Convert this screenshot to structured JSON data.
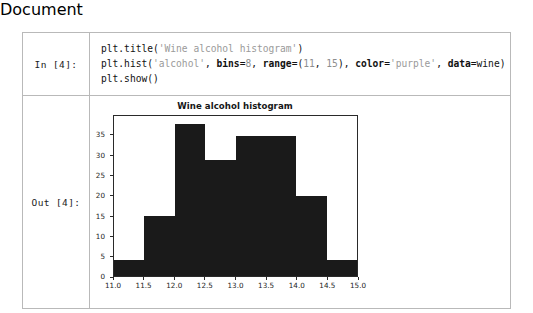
{
  "notebook": {
    "input": {
      "prompt": "In [4]:",
      "lines": [
        [
          {
            "t": "plt.title(",
            "c": "plain"
          },
          {
            "t": "'Wine alcohol histogram'",
            "c": "str"
          },
          {
            "t": ")",
            "c": "plain"
          }
        ],
        [
          {
            "t": "plt.hist(",
            "c": "plain"
          },
          {
            "t": "'alcohol'",
            "c": "str"
          },
          {
            "t": ", ",
            "c": "plain"
          },
          {
            "t": "bins",
            "c": "kw"
          },
          {
            "t": "=",
            "c": "plain"
          },
          {
            "t": "8",
            "c": "num"
          },
          {
            "t": ", ",
            "c": "plain"
          },
          {
            "t": "range",
            "c": "kw"
          },
          {
            "t": "=(",
            "c": "plain"
          },
          {
            "t": "11",
            "c": "num"
          },
          {
            "t": ", ",
            "c": "plain"
          },
          {
            "t": "15",
            "c": "num"
          },
          {
            "t": "), ",
            "c": "plain"
          },
          {
            "t": "color",
            "c": "kw"
          },
          {
            "t": "=",
            "c": "plain"
          },
          {
            "t": "'purple'",
            "c": "str"
          },
          {
            "t": ", ",
            "c": "plain"
          },
          {
            "t": "data",
            "c": "kw"
          },
          {
            "t": "=wine)",
            "c": "plain"
          }
        ],
        [
          {
            "t": "plt.show()",
            "c": "plain"
          }
        ]
      ]
    },
    "output": {
      "prompt": "Out [4]:"
    }
  },
  "chart_data": {
    "type": "bar",
    "title": "Wine alcohol histogram",
    "xlabel": "",
    "ylabel": "",
    "bar_color": "#1a1a1a",
    "grid": false,
    "legend": null,
    "bins": 8,
    "bin_range": [
      11,
      15
    ],
    "bin_edges": [
      11.0,
      11.5,
      12.0,
      12.5,
      13.0,
      13.5,
      14.0,
      14.5,
      15.0
    ],
    "categories": [
      "11.0-11.5",
      "11.5-12.0",
      "12.0-12.5",
      "12.5-13.0",
      "13.0-13.5",
      "13.5-14.0",
      "14.0-14.5",
      "14.5-15.0"
    ],
    "values": [
      4,
      15,
      38,
      29,
      35,
      35,
      20,
      4
    ],
    "xlim": [
      11.0,
      15.0
    ],
    "ylim": [
      0,
      39.9
    ],
    "xticks": [
      "11.0",
      "11.5",
      "12.0",
      "12.5",
      "13.0",
      "13.5",
      "14.0",
      "14.5",
      "15.0"
    ],
    "xtick_values": [
      11.0,
      11.5,
      12.0,
      12.5,
      13.0,
      13.5,
      14.0,
      14.5,
      15.0
    ],
    "yticks": [
      "0",
      "5",
      "10",
      "15",
      "20",
      "25",
      "30",
      "35"
    ],
    "ytick_values": [
      0,
      5,
      10,
      15,
      20,
      25,
      30,
      35
    ]
  }
}
